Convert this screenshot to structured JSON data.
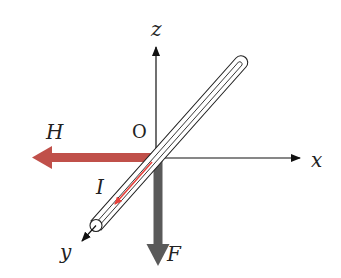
{
  "diagram": {
    "axes": {
      "x_label": "x",
      "y_label": "y",
      "z_label": "z",
      "origin_label": "O"
    },
    "vectors": {
      "H": {
        "label": "H",
        "color": "#c0504a",
        "direction": "-x"
      },
      "F": {
        "label": "F",
        "color": "#5a5a5a",
        "direction": "-z"
      },
      "I": {
        "label": "I",
        "color": "#e8403a",
        "direction": "+y"
      }
    },
    "conductor": {
      "description": "rod along y-axis",
      "stroke": "#222222"
    }
  }
}
